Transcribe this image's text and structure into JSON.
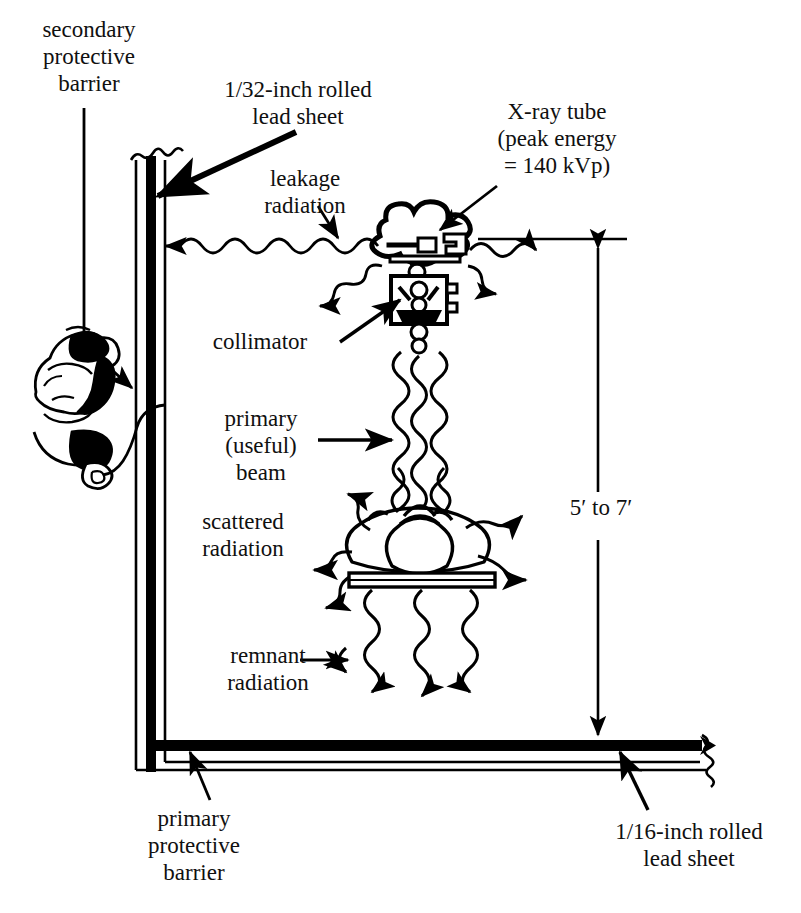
{
  "diagram": {
    "ink_color": "#000000",
    "background_color": "#ffffff"
  },
  "labels": {
    "secondary_barrier": "secondary\nprotective\nbarrier",
    "lead_sheet_32": "1/32-inch rolled\nlead sheet",
    "xray_tube": "X-ray tube\n(peak energy\n= 140 kVp)",
    "leakage_radiation": "leakage\nradiation",
    "collimator": "collimator",
    "primary_beam": "primary\n(useful)\nbeam",
    "scattered_radiation": "scattered\nradiation",
    "remnant_radiation": "remnant\nradiation",
    "height_dimension": "5′ to 7′",
    "primary_barrier": "primary\nprotective\nbarrier",
    "lead_sheet_16": "1/16-inch rolled\nlead sheet"
  },
  "components": {
    "wall": "secondary-protective-barrier-wall",
    "floor": "primary-protective-barrier-floor",
    "operator": "radiographer-behind-barrier",
    "cord": "exposure-switch-cord",
    "tube_housing": "x-ray-tube-housing",
    "collimator_box": "collimator-assembly",
    "patient": "patient-cross-section",
    "table": "radiographic-table",
    "beam_rays": 3,
    "remnant_rays": 3,
    "scatter_rays": 6,
    "leakage_rays": 2
  },
  "values": {
    "peak_energy": "140 kVp",
    "wall_lead_thickness": "1/32-inch",
    "floor_lead_thickness": "1/16-inch",
    "source_to_floor_distance": "5′ to 7′"
  }
}
